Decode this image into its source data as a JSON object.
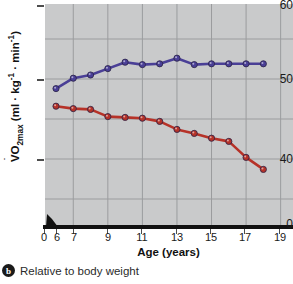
{
  "figure": {
    "caption_badge": "b",
    "caption_text": "Relative to body weight"
  },
  "axes": {
    "y_title_parts": {
      "v": "V",
      "o": "O",
      "sub": "2max",
      "units": " (ml · kg",
      "sup1": "-1",
      "mid": " · min",
      "sup2": "-1",
      "close": ")"
    },
    "y_title_plain": "VO2max (ml · kg-1 · min-1)",
    "x_title": "Age (years)",
    "y_ticks": [
      "60",
      "50",
      "40",
      "0"
    ],
    "x_ticks": [
      "0",
      "6",
      "7",
      "9",
      "11",
      "13",
      "15",
      "17",
      "19"
    ]
  },
  "colors": {
    "series_blue": "#4a3f96",
    "series_red": "#b63228",
    "plot_background": "#c9cacb",
    "gridline": "#9b9c9e",
    "axis": "#111111"
  },
  "chart_data": {
    "type": "line",
    "title": "Relative to body weight",
    "xlabel": "Age (years)",
    "ylabel": "VO2max (ml · kg-1 · min-1)",
    "xlim": [
      5,
      20
    ],
    "ylim": [
      35,
      60
    ],
    "grid": true,
    "legend": "none",
    "x": [
      6,
      7,
      8,
      9,
      10,
      11,
      12,
      13,
      14,
      15,
      16,
      17,
      18
    ],
    "series": [
      {
        "name": "Boys",
        "color": "#4a3f96",
        "values": [
          48.8,
          50.1,
          50.5,
          51.3,
          52.1,
          51.8,
          51.9,
          52.6,
          51.8,
          51.9,
          51.9,
          51.9,
          51.9
        ]
      },
      {
        "name": "Girls",
        "color": "#b63228",
        "values": [
          46.6,
          46.3,
          46.2,
          45.3,
          45.2,
          45.1,
          44.7,
          43.7,
          43.2,
          42.6,
          42.2,
          40.2,
          38.7
        ]
      }
    ]
  }
}
